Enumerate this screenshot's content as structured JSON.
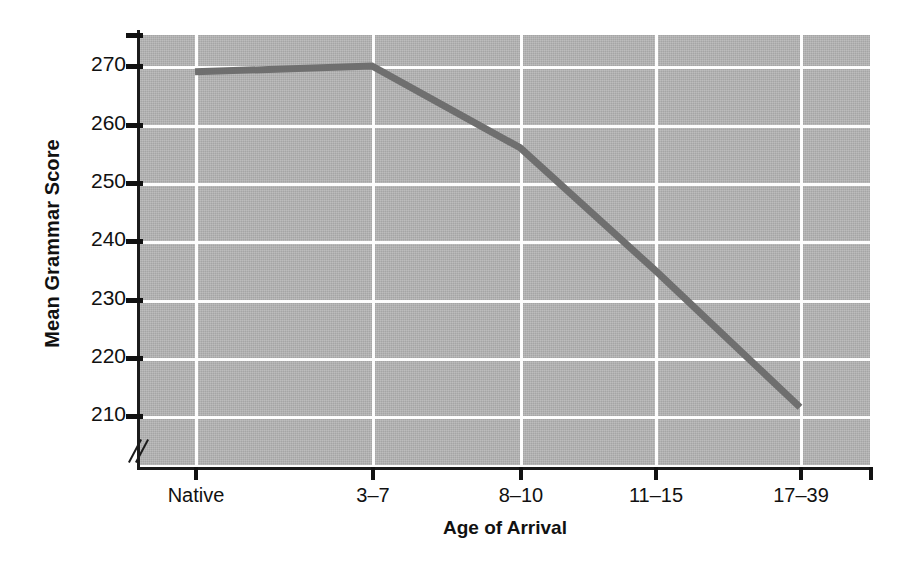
{
  "chart_data": {
    "type": "line",
    "title": "",
    "xlabel": "Age of Arrival",
    "ylabel": "Mean Grammar Score",
    "categories": [
      "Native",
      "3–7",
      "8–10",
      "11–15",
      "17–39"
    ],
    "values": [
      269,
      270,
      256,
      235,
      211.5
    ],
    "series": [
      {
        "name": "Mean Grammar Score",
        "values": [
          269,
          270,
          256,
          235,
          211.5
        ]
      }
    ],
    "ylim": [
      205,
      275
    ],
    "ytick_labels": [
      "270",
      "260",
      "250",
      "240",
      "230",
      "220",
      "210"
    ],
    "ytick_values": [
      270,
      260,
      250,
      240,
      230,
      220,
      210
    ],
    "xtick_labels": [
      "Native",
      "3–7",
      "8–10",
      "11–15",
      "17–39"
    ],
    "grid": true,
    "grid_color": "#fdfdfd",
    "legend": "none",
    "axis_break": true,
    "plot_background": "#b6b6b6",
    "line_color": "#6f6f6f",
    "axis_color": "#111111"
  },
  "axes": {
    "y_title": "Mean Grammar Score",
    "x_title": "Age of Arrival"
  },
  "yticks": [
    {
      "label": "270"
    },
    {
      "label": "260"
    },
    {
      "label": "250"
    },
    {
      "label": "240"
    },
    {
      "label": "230"
    },
    {
      "label": "220"
    },
    {
      "label": "210"
    }
  ],
  "xticks": [
    {
      "label": "Native"
    },
    {
      "label": "3–7"
    },
    {
      "label": "8–10"
    },
    {
      "label": "11–15"
    },
    {
      "label": "17–39"
    }
  ]
}
